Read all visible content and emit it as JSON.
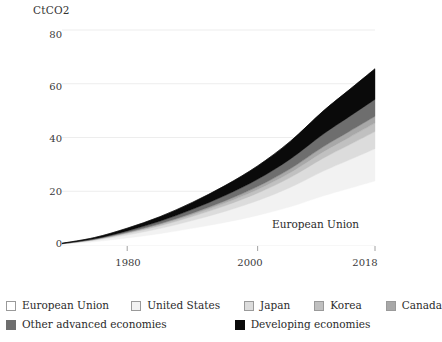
{
  "axes": {
    "y_unit_label": "CtCO2",
    "y_ticks": [
      "80",
      "60",
      "40",
      "20",
      "0"
    ],
    "x_ticks": [
      "1980",
      "2000",
      "2018"
    ]
  },
  "annotations": [
    {
      "text": "European Union"
    }
  ],
  "legend": {
    "row1": [
      {
        "label": "European Union",
        "color": "#ffffff",
        "icon": "legend-swatch-icon"
      },
      {
        "label": "United States",
        "color": "#f2f2f2",
        "icon": "legend-swatch-icon"
      },
      {
        "label": "Japan",
        "color": "#dcdcdc",
        "icon": "legend-swatch-icon"
      },
      {
        "label": "Korea",
        "color": "#c0c0c0",
        "icon": "legend-swatch-icon"
      },
      {
        "label": "Canada",
        "color": "#a8a8a8",
        "icon": "legend-swatch-icon"
      }
    ],
    "row2": [
      {
        "label": "Other advanced economies",
        "color": "#6e6e6e",
        "icon": "legend-swatch-icon"
      },
      {
        "label": "Developing economies",
        "color": "#0a0a0a",
        "icon": "legend-swatch-icon"
      }
    ]
  },
  "chart_data": {
    "type": "area",
    "title": "",
    "subtitle": "",
    "xlabel": "",
    "ylabel": "CtCO2",
    "xlim": [
      1970,
      2018
    ],
    "ylim": [
      0,
      80
    ],
    "grid": true,
    "stacked": true,
    "legend_position": "bottom",
    "x": [
      1970,
      1975,
      1980,
      1985,
      1990,
      1995,
      2000,
      2005,
      2010,
      2014,
      2018
    ],
    "series": [
      {
        "name": "European Union",
        "color": "#ffffff",
        "values": [
          0.3,
          1.2,
          2.6,
          4.2,
          6.2,
          8.4,
          11.0,
          14.2,
          18.2,
          21.0,
          23.8
        ]
      },
      {
        "name": "United States",
        "color": "#f2f2f2",
        "values": [
          0.1,
          0.5,
          1.1,
          1.9,
          2.9,
          4.1,
          5.5,
          7.2,
          9.2,
          10.6,
          12.0
        ]
      },
      {
        "name": "Japan",
        "color": "#dcdcdc",
        "values": [
          0.05,
          0.25,
          0.6,
          1.0,
          1.5,
          2.1,
          2.8,
          3.7,
          4.8,
          5.6,
          6.4
        ]
      },
      {
        "name": "Korea",
        "color": "#c0c0c0",
        "values": [
          0.02,
          0.1,
          0.25,
          0.45,
          0.7,
          1.0,
          1.35,
          1.8,
          2.35,
          2.75,
          3.15
        ]
      },
      {
        "name": "Canada",
        "color": "#a8a8a8",
        "values": [
          0.02,
          0.08,
          0.2,
          0.36,
          0.56,
          0.8,
          1.08,
          1.44,
          1.88,
          2.2,
          2.52
        ]
      },
      {
        "name": "Other advanced economies",
        "color": "#6e6e6e",
        "values": [
          0.05,
          0.2,
          0.5,
          0.9,
          1.4,
          2.0,
          2.7,
          3.6,
          4.7,
          5.5,
          6.3
        ]
      },
      {
        "name": "Developing economies",
        "color": "#0a0a0a",
        "values": [
          0.1,
          0.45,
          1.0,
          1.7,
          2.6,
          3.7,
          5.0,
          6.6,
          8.6,
          10.0,
          11.4
        ]
      }
    ],
    "total_2018": 65.6
  }
}
